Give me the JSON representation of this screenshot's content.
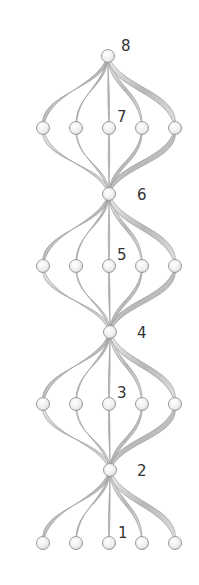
{
  "diagram": {
    "type": "twisted-ribbon lattice",
    "colors": {
      "background": "#ffffff",
      "ribbon_light": "#e4e4e4",
      "ribbon_dark": "#9a9a9a",
      "ribbon_edge": "#8c8c8c",
      "node_fill": "#f4f4f4",
      "node_stroke": "#9a9a9a",
      "label": "#333333"
    },
    "columns_x": [
      43,
      76,
      109,
      142,
      175
    ],
    "hubs": [
      {
        "id": 8,
        "label": "8",
        "x": 108,
        "y": 56,
        "label_x": 121,
        "label_y": 51
      },
      {
        "id": 6,
        "label": "6",
        "x": 109,
        "y": 194,
        "label_x": 137,
        "label_y": 200
      },
      {
        "id": 4,
        "label": "4",
        "x": 110,
        "y": 332,
        "label_x": 137,
        "label_y": 338
      },
      {
        "id": 2,
        "label": "2",
        "x": 110,
        "y": 470,
        "label_x": 137,
        "label_y": 476
      }
    ],
    "rows": [
      {
        "id": 7,
        "label": "7",
        "y": 128,
        "label_x": 117,
        "label_y": 122
      },
      {
        "id": 5,
        "label": "5",
        "y": 266,
        "label_x": 117,
        "label_y": 260
      },
      {
        "id": 3,
        "label": "3",
        "y": 404,
        "label_x": 117,
        "label_y": 398
      },
      {
        "id": 1,
        "label": "1",
        "y": 543,
        "label_x": 118,
        "label_y": 538
      }
    ]
  }
}
